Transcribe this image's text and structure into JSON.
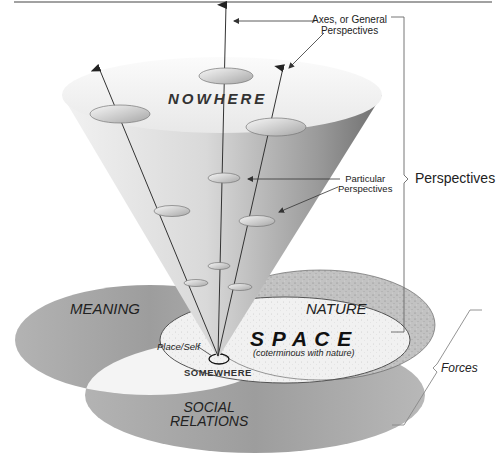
{
  "diagram": {
    "labels": {
      "axes_general": [
        "Axes, or General",
        "Perspectives"
      ],
      "nowhere": "NOWHERE",
      "particular": [
        "Particular",
        "Perspectives"
      ],
      "perspectives_brace": "Perspectives",
      "meaning": "MEANING",
      "nature": "NATURE",
      "space": "S P A C E",
      "space_note": "(coterminous with nature)",
      "place_self": "Place/Self",
      "somewhere": "SOMEWHERE",
      "social": [
        "SOCIAL",
        "RELATIONS"
      ],
      "forces_brace": "Forces"
    },
    "colors": {
      "background": "#ffffff",
      "cone_light": "#f4f4f4",
      "cone_dark": "#8a8a8a",
      "ellipse_gray": "#a9a9a9",
      "nature_speckle": "#b8b8b8",
      "space_light": "#efefef",
      "line": "#333333",
      "top_rule": "#444444"
    }
  }
}
